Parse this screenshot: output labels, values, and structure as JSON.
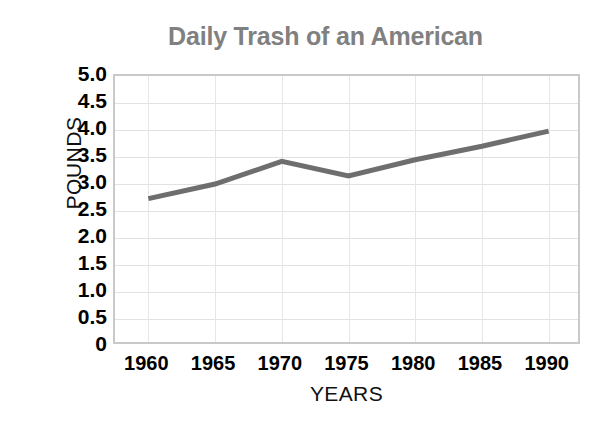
{
  "chart_data": {
    "type": "line",
    "title": "Daily Trash of an American",
    "xlabel": "YEARS",
    "ylabel": "POUNDS",
    "x": [
      1960,
      1965,
      1970,
      1975,
      1980,
      1985,
      1990
    ],
    "categories": [
      "1960",
      "1965",
      "1970",
      "1975",
      "1980",
      "1985",
      "1990"
    ],
    "values": [
      2.73,
      3.0,
      3.42,
      3.15,
      3.45,
      3.7,
      3.98
    ],
    "series": [
      {
        "name": "Daily trash per American (pounds)",
        "values": [
          2.73,
          3.0,
          3.42,
          3.15,
          3.45,
          3.7,
          3.98
        ]
      }
    ],
    "xlim": [
      1957.5,
      1992.5
    ],
    "ylim": [
      0,
      5
    ],
    "ytick_labels": [
      "5.0",
      "4.5",
      "4.0",
      "3.5",
      "3.0",
      "2.5",
      "2.0",
      "1.5",
      "1.0",
      "0.5",
      "0"
    ],
    "ytick_values": [
      5.0,
      4.5,
      4.0,
      3.5,
      3.0,
      2.5,
      2.0,
      1.5,
      1.0,
      0.5,
      0
    ],
    "grid": true,
    "legend": "none",
    "colors": {
      "line": "#6e6e6e",
      "title": "#808080",
      "grid": "#e4e4e4",
      "plot_border": "#c9c9c9",
      "tick_text": "#000000",
      "axis_title": "#111111",
      "background": "#ffffff"
    },
    "line_width_px": 5
  }
}
